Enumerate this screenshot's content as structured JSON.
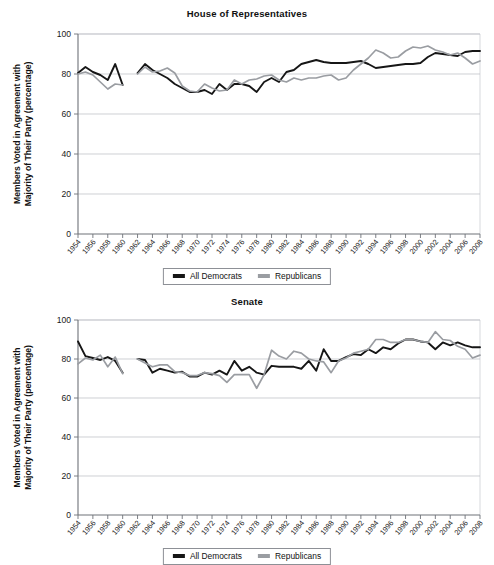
{
  "figure": {
    "panels": [
      {
        "id": "house",
        "title": "House of Representatives",
        "ylabel_line1": "Members Voted in Agreement with",
        "ylabel_line2": "Majority of Their Party (percentage)"
      },
      {
        "id": "senate",
        "title": "Senate",
        "ylabel_line1": "Members Voted in Agreement with",
        "ylabel_line2": "Majority of Their Party (percentage)"
      }
    ],
    "legend": {
      "entries": [
        {
          "label": "All Democrats",
          "color": "#161616"
        },
        {
          "label": "Republicans",
          "color": "#9a9da2"
        }
      ]
    }
  },
  "chart_data": [
    {
      "type": "line",
      "title": "House of Representatives",
      "xlabel": "",
      "ylabel": "Members Voted in Agreement with Majority of Their Party (percentage)",
      "ylim": [
        0,
        100
      ],
      "yticks": [
        0,
        20,
        40,
        60,
        80,
        100
      ],
      "xlim": [
        1954,
        2008
      ],
      "xticks": [
        1954,
        1956,
        1958,
        1960,
        1962,
        1964,
        1966,
        1968,
        1970,
        1972,
        1974,
        1976,
        1978,
        1980,
        1982,
        1984,
        1986,
        1988,
        1990,
        1992,
        1994,
        1996,
        1998,
        2000,
        2002,
        2004,
        2006,
        2008
      ],
      "grid": "horizontal",
      "legend_position": "below",
      "x": [
        1954,
        1955,
        1956,
        1957,
        1958,
        1959,
        1960,
        1962,
        1963,
        1964,
        1965,
        1966,
        1967,
        1968,
        1969,
        1970,
        1971,
        1972,
        1973,
        1974,
        1975,
        1976,
        1977,
        1978,
        1979,
        1980,
        1981,
        1982,
        1983,
        1984,
        1985,
        1986,
        1987,
        1988,
        1989,
        1990,
        1991,
        1992,
        1993,
        1994,
        1995,
        1996,
        1997,
        1998,
        1999,
        2000,
        2001,
        2002,
        2003,
        2004,
        2005,
        2006,
        2007,
        2008
      ],
      "series": [
        {
          "name": "All Democrats",
          "color": "#161616",
          "values": [
            80.5,
            83.5,
            81.0,
            79.5,
            77.0,
            85.0,
            74.5,
            80.5,
            85.0,
            82.0,
            80.0,
            78.0,
            75.0,
            73.0,
            71.0,
            71.0,
            72.0,
            70.0,
            75.0,
            72.0,
            75.0,
            75.0,
            74.0,
            71.0,
            76.0,
            78.0,
            76.0,
            81.0,
            82.0,
            85.0,
            86.0,
            87.0,
            86.0,
            85.5,
            85.5,
            85.5,
            86.0,
            86.5,
            85.0,
            83.0,
            83.5,
            84.0,
            84.5,
            85.0,
            85.0,
            85.5,
            88.5,
            90.5,
            90.0,
            89.5,
            89.0,
            91.0,
            91.5,
            91.5
          ]
        },
        {
          "name": "Republicans",
          "color": "#9a9da2",
          "values": [
            80.0,
            81.0,
            79.5,
            76.0,
            72.5,
            75.0,
            74.5,
            80.0,
            83.5,
            81.0,
            81.5,
            83.0,
            80.5,
            74.0,
            71.5,
            71.0,
            75.0,
            73.0,
            71.5,
            72.0,
            77.0,
            75.0,
            77.0,
            77.5,
            79.0,
            79.5,
            77.0,
            76.0,
            78.0,
            77.0,
            78.0,
            78.0,
            79.0,
            79.5,
            77.0,
            78.0,
            82.0,
            85.0,
            88.0,
            92.0,
            90.5,
            88.0,
            88.5,
            91.5,
            93.5,
            93.0,
            94.0,
            92.0,
            91.0,
            89.5,
            90.5,
            88.0,
            85.0,
            86.5
          ]
        }
      ]
    },
    {
      "type": "line",
      "title": "Senate",
      "xlabel": "",
      "ylabel": "Members Voted in Agreement with Majority of Their Party (percentage)",
      "ylim": [
        0,
        100
      ],
      "yticks": [
        0,
        20,
        40,
        60,
        80,
        100
      ],
      "xlim": [
        1954,
        2008
      ],
      "xticks": [
        1954,
        1956,
        1958,
        1960,
        1962,
        1964,
        1966,
        1968,
        1970,
        1972,
        1974,
        1976,
        1978,
        1980,
        1982,
        1984,
        1986,
        1988,
        1990,
        1992,
        1994,
        1996,
        1998,
        2000,
        2002,
        2004,
        2006,
        2008
      ],
      "grid": "horizontal",
      "legend_position": "below",
      "x": [
        1954,
        1955,
        1956,
        1957,
        1958,
        1959,
        1960,
        1962,
        1963,
        1964,
        1965,
        1966,
        1967,
        1968,
        1969,
        1970,
        1971,
        1972,
        1973,
        1974,
        1975,
        1976,
        1977,
        1978,
        1979,
        1980,
        1981,
        1982,
        1983,
        1984,
        1985,
        1986,
        1987,
        1988,
        1989,
        1990,
        1991,
        1992,
        1993,
        1994,
        1995,
        1996,
        1997,
        1998,
        1999,
        2000,
        2001,
        2002,
        2003,
        2004,
        2005,
        2006,
        2007,
        2008
      ],
      "series": [
        {
          "name": "All Democrats",
          "color": "#161616",
          "values": [
            89.0,
            81.5,
            80.5,
            79.5,
            81.0,
            79.0,
            73.0,
            80.0,
            79.5,
            73.0,
            75.0,
            74.0,
            73.0,
            73.5,
            71.0,
            71.0,
            73.0,
            72.0,
            74.0,
            72.0,
            79.0,
            74.0,
            76.0,
            73.0,
            72.0,
            76.5,
            76.0,
            76.0,
            76.0,
            75.0,
            79.0,
            74.0,
            85.0,
            79.0,
            79.0,
            81.0,
            82.5,
            82.0,
            85.0,
            83.0,
            86.0,
            85.0,
            88.0,
            90.0,
            90.0,
            89.0,
            88.5,
            85.0,
            88.5,
            87.0,
            88.5,
            87.0,
            86.0,
            86.0
          ]
        },
        {
          "name": "Republicans",
          "color": "#9a9da2",
          "values": [
            77.5,
            80.5,
            79.5,
            82.0,
            76.0,
            81.0,
            72.5,
            80.0,
            78.0,
            76.0,
            77.0,
            77.0,
            73.5,
            73.0,
            71.5,
            71.5,
            73.0,
            72.5,
            71.5,
            68.0,
            72.0,
            72.0,
            72.0,
            65.0,
            72.0,
            84.5,
            81.5,
            80.0,
            84.0,
            83.0,
            80.0,
            79.0,
            78.5,
            73.0,
            79.0,
            80.5,
            83.0,
            84.0,
            85.0,
            90.0,
            90.0,
            88.5,
            88.5,
            90.0,
            90.0,
            89.0,
            88.5,
            94.0,
            90.0,
            89.5,
            86.5,
            85.0,
            80.5,
            82.0
          ]
        }
      ]
    }
  ]
}
